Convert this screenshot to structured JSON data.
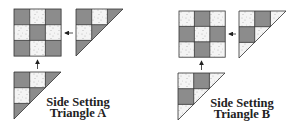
{
  "colors": {
    "dark": "#8c8c8c",
    "light": "#f4f4f4",
    "outline": "#333333",
    "speckle": "#aaaaaa"
  },
  "diagrams": [
    {
      "id": "A",
      "caption_line1": "Side Setting",
      "caption_line2": "Triangle A",
      "block_pattern": [
        [
          "dark",
          "light",
          "dark"
        ],
        [
          "light",
          "dark",
          "light"
        ],
        [
          "dark",
          "light",
          "dark"
        ]
      ],
      "top_triangle_pattern": [
        "dark",
        "light",
        "light",
        "dark",
        "dark"
      ],
      "bottom_triangle_pattern": [
        "dark",
        "light",
        "light",
        "dark",
        "dark"
      ]
    },
    {
      "id": "B",
      "caption_line1": "Side Setting",
      "caption_line2": "Triangle B",
      "block_pattern": [
        [
          "light",
          "dark",
          "light"
        ],
        [
          "dark",
          "light",
          "dark"
        ],
        [
          "light",
          "dark",
          "light"
        ]
      ],
      "top_triangle_pattern": [
        "light",
        "dark",
        "dark",
        "light",
        "light"
      ],
      "bottom_triangle_pattern": [
        "light",
        "dark",
        "dark",
        "light",
        "light"
      ]
    }
  ]
}
